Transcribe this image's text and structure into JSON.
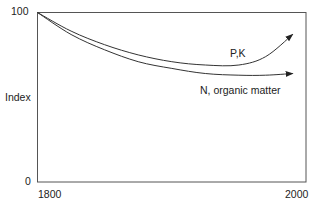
{
  "chart_data": {
    "type": "line",
    "title": "",
    "xlabel": "",
    "ylabel": "Index",
    "xlim": [
      1800,
      2000
    ],
    "ylim": [
      0,
      100
    ],
    "x_ticks": [
      "1800",
      "2000"
    ],
    "y_ticks": [
      "0",
      "100"
    ],
    "grid": false,
    "legend": "inline labels",
    "series": [
      {
        "name": "P,K",
        "x": [
          1800,
          1825,
          1850,
          1875,
          1900,
          1925,
          1950,
          1970,
          1990
        ],
        "values": [
          100,
          89,
          81,
          75,
          71,
          69,
          69,
          74,
          87
        ],
        "arrow_end": true
      },
      {
        "name": "N, organic matter",
        "x": [
          1800,
          1825,
          1850,
          1875,
          1900,
          1925,
          1950,
          1970,
          1990
        ],
        "values": [
          100,
          87,
          78,
          71,
          67,
          64,
          63,
          63,
          64
        ],
        "arrow_end": true
      }
    ]
  },
  "labels": {
    "y_top": "100",
    "y_bottom": "0",
    "y_axis": "Index",
    "x_left": "1800",
    "x_right": "2000",
    "series_pk": "P,K",
    "series_n": "N, organic matter"
  }
}
